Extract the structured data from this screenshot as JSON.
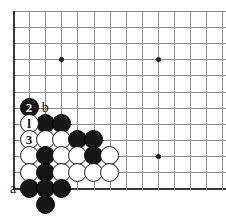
{
  "figure": {
    "type": "go-board-diagram",
    "title": "",
    "board": {
      "origin_x": 13,
      "origin_y": 11,
      "spacing": 16.1,
      "cols_visible": 14,
      "rows_visible": 12,
      "line_color": "#8a8a8a",
      "edge_color": "#3a3a3a",
      "background": "#ffffff"
    },
    "star_points": [
      {
        "col": 3,
        "row": 3
      },
      {
        "col": 9,
        "row": 3
      },
      {
        "col": 9,
        "row": 9
      }
    ],
    "stones": [
      {
        "col": 1,
        "row": 6,
        "color": "black",
        "number": "2",
        "name": "move-2-black"
      },
      {
        "col": 2,
        "row": 7,
        "color": "black",
        "number": "",
        "name": "black-stone"
      },
      {
        "col": 3,
        "row": 7,
        "color": "black",
        "number": "",
        "name": "black-stone"
      },
      {
        "col": 1,
        "row": 7,
        "color": "white",
        "number": "l",
        "name": "move-1-white"
      },
      {
        "col": 1,
        "row": 8,
        "color": "white",
        "number": "3",
        "name": "move-3-white"
      },
      {
        "col": 2,
        "row": 8,
        "color": "white",
        "number": "",
        "name": "white-stone"
      },
      {
        "col": 3,
        "row": 8,
        "color": "white",
        "number": "",
        "name": "white-stone"
      },
      {
        "col": 4,
        "row": 8,
        "color": "black",
        "number": "",
        "name": "black-stone"
      },
      {
        "col": 5,
        "row": 8,
        "color": "black",
        "number": "",
        "name": "black-stone"
      },
      {
        "col": 1,
        "row": 9,
        "color": "white",
        "number": "",
        "name": "white-stone"
      },
      {
        "col": 2,
        "row": 9,
        "color": "black",
        "number": "",
        "name": "black-stone"
      },
      {
        "col": 3,
        "row": 9,
        "color": "white",
        "number": "",
        "name": "white-stone"
      },
      {
        "col": 4,
        "row": 9,
        "color": "white",
        "number": "",
        "name": "white-stone"
      },
      {
        "col": 5,
        "row": 9,
        "color": "black",
        "number": "",
        "name": "black-stone"
      },
      {
        "col": 6,
        "row": 9,
        "color": "white",
        "number": "",
        "name": "white-stone"
      },
      {
        "col": 1,
        "row": 10,
        "color": "white",
        "number": "",
        "name": "white-stone"
      },
      {
        "col": 2,
        "row": 10,
        "color": "black",
        "number": "",
        "name": "black-stone"
      },
      {
        "col": 3,
        "row": 10,
        "color": "white",
        "number": "",
        "name": "white-stone"
      },
      {
        "col": 4,
        "row": 10,
        "color": "white",
        "number": "",
        "name": "white-stone"
      },
      {
        "col": 5,
        "row": 10,
        "color": "white",
        "number": "",
        "name": "white-stone"
      },
      {
        "col": 6,
        "row": 10,
        "color": "white",
        "number": "",
        "name": "white-stone"
      },
      {
        "col": 1,
        "row": 11,
        "color": "black",
        "number": "",
        "name": "black-stone"
      },
      {
        "col": 2,
        "row": 11,
        "color": "black",
        "number": "",
        "name": "black-stone"
      },
      {
        "col": 3,
        "row": 11,
        "color": "black",
        "number": "",
        "name": "black-stone"
      },
      {
        "col": 2,
        "row": 12,
        "color": "black",
        "number": "",
        "name": "black-stone"
      }
    ],
    "coordinate_labels": [
      {
        "col": 2,
        "row": 6,
        "text": "b",
        "name": "point-label-b"
      },
      {
        "col": 0,
        "row": 11,
        "text": "a",
        "name": "point-label-a"
      }
    ]
  }
}
